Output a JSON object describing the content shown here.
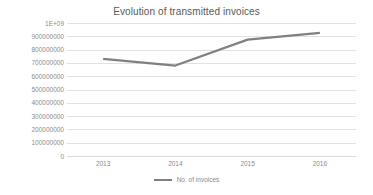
{
  "chart_data": {
    "type": "line",
    "title": "Evolution of transmitted invoices",
    "xlabel": "",
    "ylabel": "",
    "categories": [
      "2013",
      "2014",
      "2015",
      "2016"
    ],
    "series": [
      {
        "name": "No. of invoices",
        "values": [
          730000000,
          680000000,
          875000000,
          925000000
        ],
        "color": "#808080"
      }
    ],
    "ylim": [
      0,
      1000000000
    ],
    "ytick_labels": [
      "1E+09",
      "900000000",
      "800000000",
      "700000000",
      "600000000",
      "500000000",
      "400000000",
      "300000000",
      "200000000",
      "100000000",
      "0"
    ],
    "ytick_values": [
      1000000000,
      900000000,
      800000000,
      700000000,
      600000000,
      500000000,
      400000000,
      300000000,
      200000000,
      100000000,
      0
    ],
    "grid": true,
    "legend_position": "bottom",
    "legend_entries": [
      "No. of invoices"
    ],
    "colors": {
      "line": "#808080",
      "gridline": "#e2e2e2",
      "title_text": "#595959",
      "tick_text": "#8c8c8c",
      "background": "#ffffff"
    }
  }
}
